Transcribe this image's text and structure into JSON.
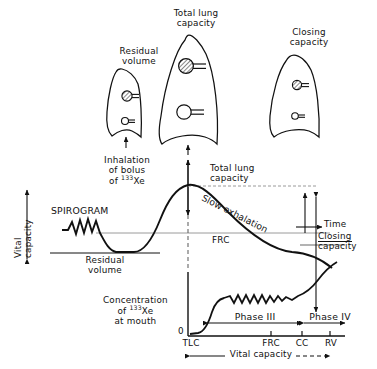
{
  "figure": {
    "type": "physiology-diagram",
    "isotope": "133Xe"
  },
  "lungs": [
    {
      "id": "residual-volume",
      "label_line1": "Residual",
      "label_line2": "volume",
      "size": "small",
      "upper_alveolus": "shaded",
      "lower_alveolus": "open"
    },
    {
      "id": "total-lung-capacity",
      "label_line1": "Total lung",
      "label_line2": "capacity",
      "size": "large",
      "upper_alveolus": "shaded",
      "lower_alveolus": "open"
    },
    {
      "id": "closing-capacity",
      "label_line1": "Closing",
      "label_line2": "capacity",
      "size": "medium",
      "upper_alveolus": "shaded",
      "lower_alveolus": "open"
    }
  ],
  "spirogram": {
    "title": "SPIROGRAM",
    "y_axis_label_line1": "Vital",
    "y_axis_label_line2": "capacity",
    "inhalation_line1": "Inhalation",
    "inhalation_line2": "of bolus",
    "inhalation_line3_prefix": "of ",
    "inhalation_line3_sup": "133",
    "inhalation_line3_suffix": "Xe",
    "residual_volume_line1": "Residual",
    "residual_volume_line2": "volume",
    "tlc_line1": "Total lung",
    "tlc_line2": "capacity",
    "slow_exhalation": "Slow exhalation",
    "frc": "FRC",
    "time": "Time",
    "closing_capacity_line1": "Closing",
    "closing_capacity_line2": "capacity"
  },
  "concentration": {
    "y_label_line1": "Concentration",
    "y_label_line2_prefix": "of ",
    "y_label_line2_sup": "133",
    "y_label_line2_suffix": "Xe",
    "y_label_line3": "at mouth",
    "zero": "0",
    "phase3": "Phase III",
    "phase4": "Phase IV",
    "x_axis_span_label": "Vital capacity",
    "ticks": [
      {
        "label": "TLC"
      },
      {
        "label": "FRC"
      },
      {
        "label": "CC"
      },
      {
        "label": "RV"
      }
    ]
  },
  "colors": {
    "ink": "#111111",
    "background": "#ffffff",
    "dashed": "#8a8a8a"
  }
}
